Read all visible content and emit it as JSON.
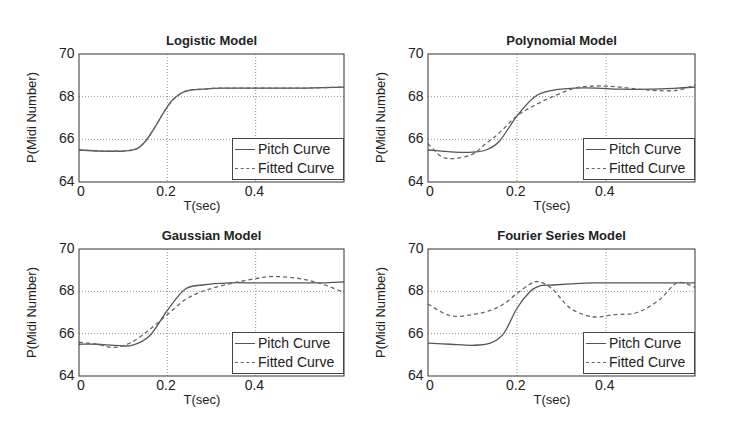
{
  "chart_data": [
    {
      "type": "line",
      "title": "Logistic Model",
      "xlabel": "T(sec)",
      "ylabel": "P(Midi Number)",
      "xlim": [
        0,
        0.6
      ],
      "ylim": [
        64,
        70
      ],
      "xticks": [
        "0",
        "0.2",
        "0.4"
      ],
      "yticks": [
        "64",
        "66",
        "68",
        "70"
      ],
      "grid": true,
      "legend": [
        "Pitch Curve",
        "Fitted Curve"
      ],
      "legend_position": "lower right",
      "x": [
        0,
        0.05,
        0.1,
        0.13,
        0.15,
        0.17,
        0.19,
        0.21,
        0.23,
        0.25,
        0.28,
        0.32,
        0.4,
        0.5,
        0.6
      ],
      "series": [
        {
          "name": "Pitch Curve",
          "style": "solid",
          "values": [
            65.5,
            65.45,
            65.45,
            65.55,
            65.9,
            66.5,
            67.2,
            67.8,
            68.15,
            68.3,
            68.35,
            68.4,
            68.4,
            68.4,
            68.45
          ]
        },
        {
          "name": "Fitted Curve",
          "style": "dashed",
          "values": [
            65.5,
            65.45,
            65.45,
            65.55,
            65.9,
            66.5,
            67.2,
            67.8,
            68.15,
            68.3,
            68.35,
            68.4,
            68.4,
            68.4,
            68.45
          ]
        }
      ]
    },
    {
      "type": "line",
      "title": "Polynomial Model",
      "xlabel": "T(sec)",
      "ylabel": "P(Midi Number)",
      "xlim": [
        0,
        0.6
      ],
      "ylim": [
        64,
        70
      ],
      "xticks": [
        "0",
        "0.2",
        "0.4"
      ],
      "yticks": [
        "64",
        "66",
        "68",
        "70"
      ],
      "grid": true,
      "legend": [
        "Pitch Curve",
        "Fitted Curve"
      ],
      "legend_position": "lower right",
      "x": [
        0,
        0.03,
        0.06,
        0.1,
        0.13,
        0.16,
        0.2,
        0.24,
        0.28,
        0.33,
        0.38,
        0.43,
        0.5,
        0.56,
        0.6
      ],
      "series": [
        {
          "name": "Pitch Curve",
          "style": "solid",
          "values": [
            65.5,
            65.45,
            65.4,
            65.4,
            65.5,
            65.9,
            67.1,
            68.0,
            68.3,
            68.4,
            68.4,
            68.35,
            68.35,
            68.4,
            68.45
          ]
        },
        {
          "name": "Fitted Curve",
          "style": "dashed",
          "values": [
            65.8,
            65.2,
            65.1,
            65.3,
            65.8,
            66.3,
            67.1,
            67.6,
            68.0,
            68.4,
            68.5,
            68.45,
            68.3,
            68.3,
            68.55
          ]
        }
      ]
    },
    {
      "type": "line",
      "title": "Gaussian Model",
      "xlabel": "T(sec)",
      "ylabel": "P(Midi Number)",
      "xlim": [
        0,
        0.6
      ],
      "ylim": [
        64,
        70
      ],
      "xticks": [
        "0",
        "0.2",
        "0.4"
      ],
      "yticks": [
        "64",
        "66",
        "68",
        "70"
      ],
      "grid": true,
      "legend": [
        "Pitch Curve",
        "Fitted Curve"
      ],
      "legend_position": "lower right",
      "x": [
        0,
        0.04,
        0.08,
        0.12,
        0.16,
        0.2,
        0.24,
        0.28,
        0.34,
        0.4,
        0.44,
        0.5,
        0.55,
        0.6
      ],
      "series": [
        {
          "name": "Pitch Curve",
          "style": "solid",
          "values": [
            65.5,
            65.5,
            65.45,
            65.45,
            65.9,
            67.1,
            68.1,
            68.3,
            68.4,
            68.4,
            68.4,
            68.4,
            68.4,
            68.45
          ]
        },
        {
          "name": "Fitted Curve",
          "style": "dashed",
          "values": [
            65.6,
            65.5,
            65.35,
            65.6,
            66.2,
            66.9,
            67.6,
            68.0,
            68.35,
            68.6,
            68.7,
            68.6,
            68.35,
            67.95
          ]
        }
      ]
    },
    {
      "type": "line",
      "title": "Fourier Series Model",
      "xlabel": "T(sec)",
      "ylabel": "P(Midi Number)",
      "xlim": [
        0,
        0.6
      ],
      "ylim": [
        64,
        70
      ],
      "xticks": [
        "0",
        "0.2",
        "0.4"
      ],
      "yticks": [
        "64",
        "66",
        "68",
        "70"
      ],
      "grid": true,
      "legend": [
        "Pitch Curve",
        "Fitted Curve"
      ],
      "legend_position": "lower right",
      "x": [
        0,
        0.05,
        0.1,
        0.14,
        0.17,
        0.2,
        0.23,
        0.25,
        0.28,
        0.32,
        0.37,
        0.42,
        0.47,
        0.52,
        0.56,
        0.6
      ],
      "series": [
        {
          "name": "Pitch Curve",
          "style": "solid",
          "values": [
            65.55,
            65.5,
            65.45,
            65.55,
            66.0,
            67.2,
            68.0,
            68.25,
            68.3,
            68.35,
            68.4,
            68.4,
            68.4,
            68.4,
            68.4,
            68.4
          ]
        },
        {
          "name": "Fitted Curve",
          "style": "dashed",
          "values": [
            67.4,
            66.85,
            66.9,
            67.1,
            67.4,
            67.9,
            68.35,
            68.45,
            68.1,
            67.2,
            66.8,
            66.9,
            67.0,
            67.6,
            68.4,
            68.2
          ]
        }
      ]
    }
  ]
}
